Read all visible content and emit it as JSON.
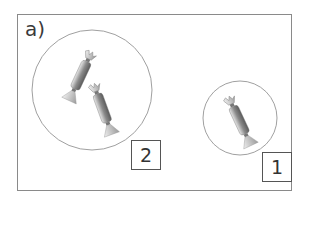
{
  "figure": {
    "label": "a)",
    "groups": [
      {
        "name": "large-group",
        "number": "2",
        "candy_count": 2
      },
      {
        "name": "small-group",
        "number": "1",
        "candy_count": 1
      }
    ]
  },
  "colors": {
    "frame": "#8a8a8a",
    "circle": "#a0a0a0",
    "box": "#555555"
  }
}
